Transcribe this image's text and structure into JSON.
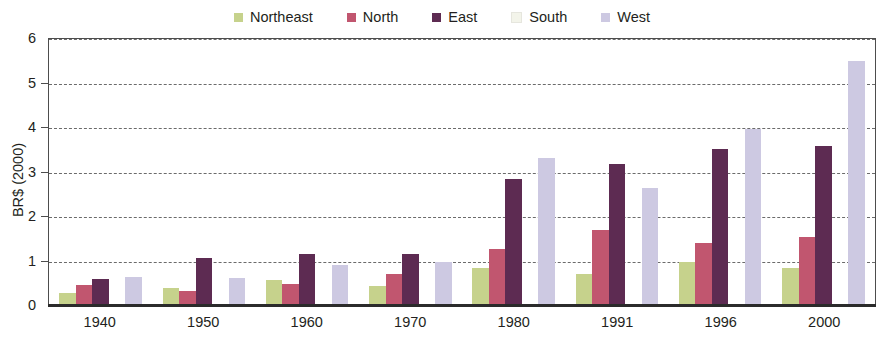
{
  "chart_data": {
    "type": "bar",
    "title": "",
    "subtitle": "",
    "xlabel": "",
    "ylabel": "BR$ (2000)",
    "categories": [
      "1940",
      "1950",
      "1960",
      "1970",
      "1980",
      "1991",
      "1996",
      "2000"
    ],
    "ylim": [
      0,
      6
    ],
    "yticks": [
      0,
      1,
      2,
      3,
      4,
      5,
      6
    ],
    "ytick_labels": [
      "0",
      "1",
      "2",
      "3",
      "4",
      "5",
      "6"
    ],
    "grid": true,
    "grid_axis": "y",
    "grid_style": "dashed",
    "legend_position": "top-center",
    "series": [
      {
        "name": "Northeast",
        "color": "#c6d28c",
        "values": [
          0.25,
          0.37,
          0.54,
          0.4,
          0.81,
          0.67,
          0.94,
          0.82
        ]
      },
      {
        "name": "North",
        "color": "#c1566f",
        "values": [
          0.42,
          0.3,
          0.44,
          0.68,
          1.23,
          1.66,
          1.37,
          1.5
        ]
      },
      {
        "name": "East",
        "color": "#5d2b52",
        "values": [
          0.57,
          1.03,
          1.13,
          1.12,
          2.8,
          3.14,
          3.48,
          3.55
        ]
      },
      {
        "name": "South",
        "color": "#f3f4ea",
        "values": [
          0.0,
          0.0,
          0.0,
          0.0,
          0.0,
          0.0,
          0.0,
          0.0
        ]
      },
      {
        "name": "West",
        "color": "#cdc9e2",
        "values": [
          0.6,
          0.58,
          0.88,
          0.95,
          3.29,
          2.6,
          3.93,
          5.46
        ]
      }
    ]
  },
  "legend": {
    "items": [
      {
        "label": "Northeast",
        "color": "#c6d28c"
      },
      {
        "label": "North",
        "color": "#c1566f"
      },
      {
        "label": "East",
        "color": "#5d2b52"
      },
      {
        "label": "South",
        "color": "#f3f4ea"
      },
      {
        "label": "West",
        "color": "#cdc9e2"
      }
    ]
  },
  "axes": {
    "y_title": "BR$ (2000)",
    "y_ticks": [
      "6",
      "5",
      "4",
      "3",
      "2",
      "1",
      "0"
    ],
    "x_ticks": [
      "1940",
      "1950",
      "1960",
      "1970",
      "1980",
      "1991",
      "1996",
      "2000"
    ]
  }
}
